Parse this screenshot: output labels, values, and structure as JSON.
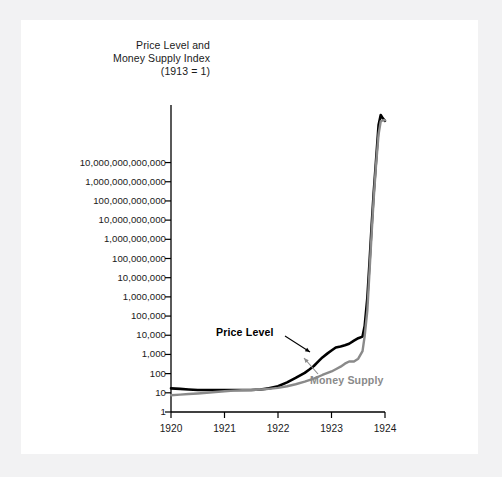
{
  "figure": {
    "background_color": "#f2f2f3",
    "plate_color": "#ffffff"
  },
  "chart_data": {
    "type": "line",
    "title": "Price Level and Money Supply Index (1913 = 1)",
    "title_lines": [
      "Price Level and",
      "Money Supply Index",
      "(1913 = 1)"
    ],
    "xlabel": "",
    "ylabel": "Price Level and Money Supply Index (1913 = 1)",
    "yscale": "log",
    "ylim": [
      1,
      10000000000000000
    ],
    "xlim": [
      1920,
      1924
    ],
    "grid": false,
    "legend_position": "inline-annotations",
    "ytick_labels": [
      "10,000,000,000,000",
      "1,000,000,000,000",
      "100,000,000,000",
      "10,000,000,000",
      "1,000,000,000",
      "100,000,000",
      "10,000,000",
      "1,000,000",
      "100,000",
      "10,000",
      "1,000",
      "100",
      "10",
      "1"
    ],
    "ytick_values": [
      10000000000000.0,
      1000000000000.0,
      100000000000.0,
      10000000000.0,
      1000000000.0,
      100000000.0,
      10000000.0,
      1000000.0,
      100000.0,
      10000.0,
      1000.0,
      100,
      10,
      1
    ],
    "xtick_labels": [
      "1920",
      "1921",
      "1922",
      "1923",
      "1924"
    ],
    "xtick_values": [
      1920,
      1921,
      1922,
      1923,
      1924
    ],
    "series": [
      {
        "name": "Price Level",
        "color": "#000000",
        "label_color": "#000000",
        "x": [
          1920.0,
          1920.17,
          1920.33,
          1920.5,
          1920.67,
          1920.83,
          1921.0,
          1921.17,
          1921.33,
          1921.5,
          1921.67,
          1921.83,
          1922.0,
          1922.17,
          1922.33,
          1922.5,
          1922.58,
          1922.67,
          1922.75,
          1922.83,
          1922.92,
          1923.0,
          1923.08,
          1923.17,
          1923.25,
          1923.33,
          1923.42,
          1923.5,
          1923.58,
          1923.62,
          1923.67,
          1923.71,
          1923.75,
          1923.79,
          1923.83,
          1923.88,
          1923.92,
          1923.96,
          1924.0
        ],
        "y": [
          17,
          16,
          15,
          14,
          14,
          14,
          14,
          14,
          14,
          14,
          15,
          17,
          22,
          35,
          60,
          110,
          160,
          250,
          420,
          700,
          1100,
          1600,
          2300,
          2600,
          3000,
          3600,
          5200,
          7000,
          8500,
          30000,
          900000,
          60000000,
          5000000000,
          300000000000,
          10000000000000,
          900000000000000,
          3000000000000000,
          2000000000000000,
          1500000000000000
        ]
      },
      {
        "name": "Money Supply",
        "color": "#8a8a8a",
        "label_color": "#8a8a8a",
        "x": [
          1920.0,
          1920.17,
          1920.33,
          1920.5,
          1920.67,
          1920.83,
          1921.0,
          1921.17,
          1921.33,
          1921.5,
          1921.67,
          1921.83,
          1922.0,
          1922.17,
          1922.33,
          1922.5,
          1922.67,
          1922.83,
          1923.0,
          1923.08,
          1923.17,
          1923.25,
          1923.33,
          1923.42,
          1923.5,
          1923.58,
          1923.62,
          1923.67,
          1923.71,
          1923.75,
          1923.79,
          1923.83,
          1923.88,
          1923.92,
          1923.96,
          1924.0
        ],
        "y": [
          7.5,
          8.0,
          8.6,
          9.2,
          10,
          11,
          12,
          13,
          13.5,
          14,
          15,
          16,
          18,
          22,
          28,
          38,
          55,
          85,
          130,
          170,
          230,
          330,
          430,
          430,
          600,
          1500,
          9000,
          200000,
          20000000,
          2000000000,
          150000000000,
          6000000000000,
          300000000000000,
          1400000000000000,
          1600000000000000,
          1600000000000000
        ]
      }
    ],
    "annotations": [
      {
        "text": "Price Level",
        "x": 216,
        "y": 326,
        "arrow_from": [
          285,
          336
        ],
        "arrow_to": [
          310,
          352
        ]
      },
      {
        "text": "Money Supply",
        "x": 310,
        "y": 374,
        "arrow_from": [
          318,
          374
        ],
        "arrow_to": [
          304,
          358
        ]
      }
    ]
  }
}
